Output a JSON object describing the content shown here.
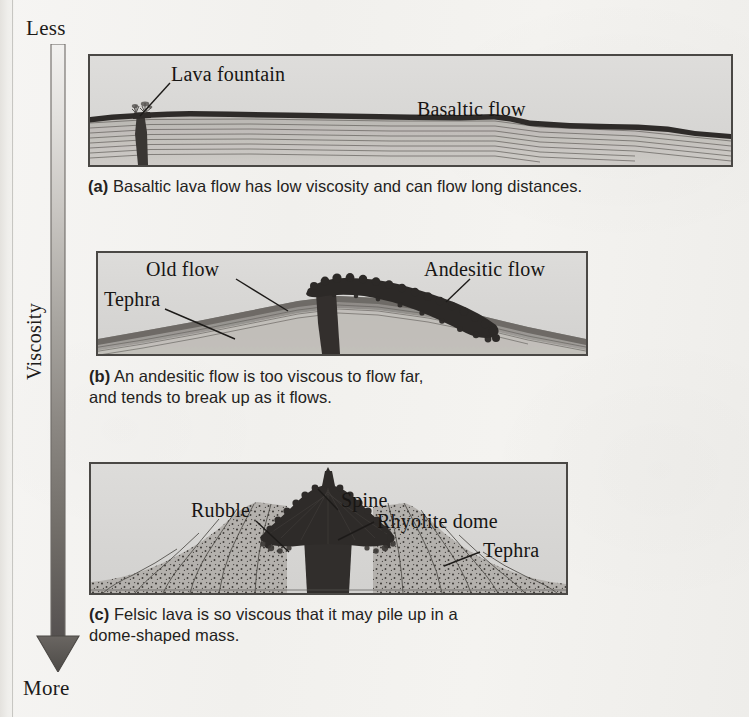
{
  "figure": {
    "background_color": "#f2f1ee",
    "panel_fill_color": "#d9d8d6",
    "panel_border_color": "#4a4845",
    "lava_dark_color": "#2f2c2a",
    "tephra_color": "#9a9793"
  },
  "axis": {
    "name": "Viscosity",
    "top_label": "Less",
    "bottom_label": "More",
    "rotated_label": "Viscosity",
    "direction": "downward",
    "gradient_from": "#f0efed",
    "gradient_to": "#57534f"
  },
  "panels": [
    {
      "key": "a",
      "marker": "(a)",
      "caption_marker": "(a)",
      "caption_text": " Basaltic lava flow has low viscosity and can flow long distances.",
      "labels": [
        {
          "name": "lava-fountain",
          "text": "Lava fountain"
        },
        {
          "name": "basaltic-flow",
          "text": "Basaltic flow"
        }
      ]
    },
    {
      "key": "b",
      "marker": "(b)",
      "caption_marker": "(b)",
      "caption_text": " An andesitic flow is too viscous to flow far,\nand tends to break up as it flows.",
      "labels": [
        {
          "name": "old-flow",
          "text": "Old flow"
        },
        {
          "name": "tephra",
          "text": "Tephra"
        },
        {
          "name": "andesitic-flow",
          "text": "Andesitic flow"
        }
      ]
    },
    {
      "key": "c",
      "marker": "(c)",
      "caption_marker": "(c)",
      "caption_text": " Felsic lava is so viscous that it may pile up in a\ndome-shaped mass.",
      "labels": [
        {
          "name": "spine",
          "text": "Spine"
        },
        {
          "name": "rubble",
          "text": "Rubble"
        },
        {
          "name": "rhyolite-dome",
          "text": "Rhyolite dome"
        },
        {
          "name": "tephra",
          "text": "Tephra"
        }
      ]
    }
  ],
  "labels": {
    "lava_fountain": "Lava fountain",
    "basaltic_flow": "Basaltic flow",
    "old_flow": "Old flow",
    "tephra_b": "Tephra",
    "andesitic_flow": "Andesitic flow",
    "spine": "Spine",
    "rubble": "Rubble",
    "rhyolite_dome": "Rhyolite dome",
    "tephra_c": "Tephra"
  },
  "captions": {
    "a_marker": "(a)",
    "a_text": " Basaltic lava flow has low viscosity and can flow long distances.",
    "b_marker": "(b)",
    "b_text": " An andesitic flow is too viscous to flow far,\nand tends to break up as it flows.",
    "c_marker": "(c)",
    "c_text": " Felsic lava is so viscous that it may pile up in a\ndome-shaped mass."
  }
}
